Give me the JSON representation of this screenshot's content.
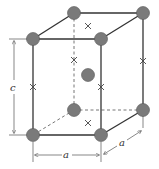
{
  "diagram": {
    "type": "unit-cell",
    "labels": {
      "height": "c",
      "width_front": "a",
      "width_side": "a"
    },
    "atom_color": "#7a7a7a",
    "line_color": "#333333"
  }
}
